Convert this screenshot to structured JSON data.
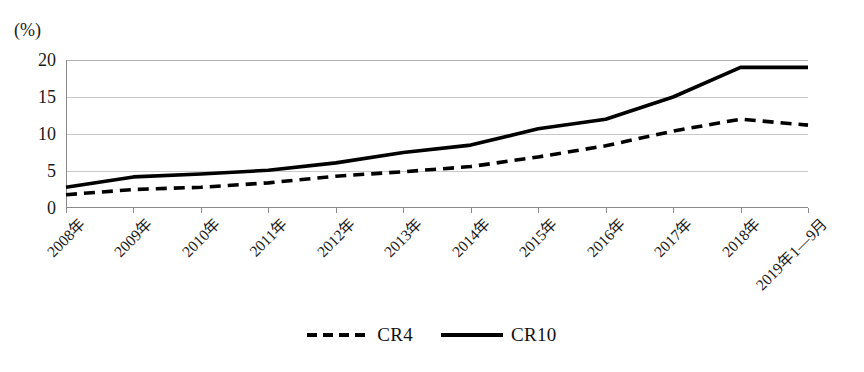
{
  "chart_data": {
    "type": "line",
    "title": "",
    "xlabel": "",
    "ylabel": "(%)",
    "unit_label": "(%)",
    "ylim": [
      0,
      20
    ],
    "yticks": [
      0,
      5,
      10,
      15,
      20
    ],
    "ytick_labels": [
      "0",
      "5",
      "10",
      "15",
      "20"
    ],
    "grid": true,
    "grid_axis": "y",
    "legend_position": "bottom-center",
    "categories": [
      "2008年",
      "2009年",
      "2010年",
      "2011年",
      "2012年",
      "2013年",
      "2014年",
      "2015年",
      "2016年",
      "2017年",
      "2018年",
      "2019年1—9月"
    ],
    "series": [
      {
        "name": "CR4",
        "style": "dashed",
        "color": "#000000",
        "values": [
          1.8,
          2.5,
          2.8,
          3.4,
          4.3,
          4.9,
          5.6,
          6.9,
          8.4,
          10.4,
          12.0,
          11.2
        ]
      },
      {
        "name": "CR10",
        "style": "solid",
        "color": "#000000",
        "values": [
          2.8,
          4.2,
          4.6,
          5.1,
          6.1,
          7.5,
          8.5,
          10.7,
          12.0,
          15.0,
          19.0,
          19.0
        ]
      }
    ]
  },
  "legend": {
    "items": [
      {
        "label": "CR4",
        "style": "dashed"
      },
      {
        "label": "CR10",
        "style": "solid"
      }
    ]
  }
}
